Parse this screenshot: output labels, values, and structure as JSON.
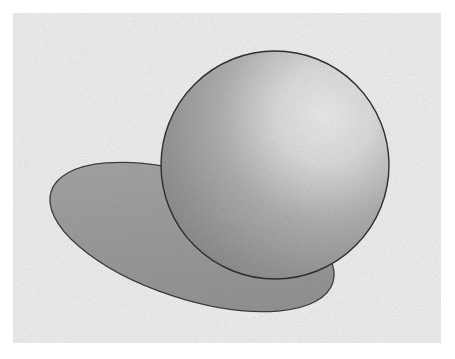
{
  "image": {
    "subject": "Pencil drawing of a shaded sphere casting an elliptical shadow",
    "colors": {
      "border": "#ffffff",
      "paper": "#efefef",
      "outline": "#3a3a3a",
      "shadow": "#9a9a9a",
      "sphere_dark": "#8c8c8c",
      "sphere_light": "#e6e6e6"
    },
    "sphere": {
      "cx": 275,
      "cy": 165,
      "r": 114
    },
    "shadow_ellipse": {
      "cx": 192,
      "cy": 237,
      "rx": 148,
      "ry": 62,
      "rotate": 18
    }
  }
}
